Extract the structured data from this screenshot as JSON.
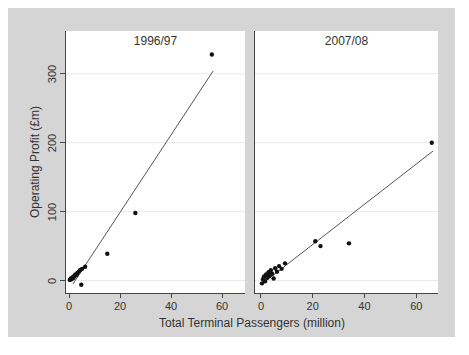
{
  "figure": {
    "background_color": "#d5d5d5",
    "panel_color": "#ffffff",
    "gridline_color": "#e9e9e9",
    "axis_color": "#454545",
    "text_color": "#333333",
    "point_color": "#111111",
    "trend_color": "#555555"
  },
  "chart_data": {
    "type": "scatter",
    "title": "",
    "xlabel": "Total Terminal Passengers (million)",
    "ylabel": "Operating Profit (£m)",
    "x_ticks": [
      0,
      20,
      40,
      60
    ],
    "y_ticks": [
      0,
      100,
      200,
      300
    ],
    "ylim": [
      -18,
      362
    ],
    "grid": "horizontal-only",
    "legend": "none",
    "panels": [
      {
        "title": "1996/97",
        "xlim": [
          -1.2,
          69
        ],
        "points": [
          [
            0.3,
            1
          ],
          [
            0.7,
            3
          ],
          [
            1.0,
            2
          ],
          [
            1.4,
            5
          ],
          [
            1.8,
            4
          ],
          [
            2.1,
            7
          ],
          [
            2.5,
            9
          ],
          [
            2.9,
            8
          ],
          [
            3.3,
            11
          ],
          [
            3.8,
            13
          ],
          [
            4.3,
            15
          ],
          [
            5.1,
            17
          ],
          [
            6.3,
            20
          ],
          [
            4.8,
            -6
          ],
          [
            15,
            39
          ],
          [
            26,
            98
          ],
          [
            56,
            328
          ]
        ],
        "trend_line": {
          "x1": 1.5,
          "y1": -5,
          "x2": 56.5,
          "y2": 304
        }
      },
      {
        "title": "2007/08",
        "xlim": [
          -2.3,
          68.4
        ],
        "points": [
          [
            0.4,
            -4
          ],
          [
            0.8,
            2
          ],
          [
            1.2,
            6
          ],
          [
            1.6,
            -1
          ],
          [
            2.0,
            9
          ],
          [
            2.4,
            4
          ],
          [
            2.9,
            12
          ],
          [
            3.3,
            7
          ],
          [
            3.8,
            15
          ],
          [
            4.3,
            10
          ],
          [
            4.9,
            3
          ],
          [
            5.5,
            18
          ],
          [
            6.2,
            13
          ],
          [
            7.0,
            21
          ],
          [
            8.0,
            17
          ],
          [
            9.3,
            25
          ],
          [
            21,
            57
          ],
          [
            23,
            50
          ],
          [
            34,
            54
          ],
          [
            66,
            200
          ]
        ],
        "trend_line": {
          "x1": 0,
          "y1": -6,
          "x2": 66.5,
          "y2": 188
        }
      }
    ]
  }
}
